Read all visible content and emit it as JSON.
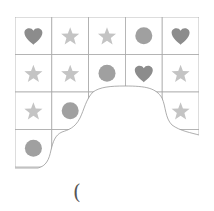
{
  "puzzle": {
    "description": "Grid of shapes with a torn-out region",
    "rows": [
      [
        "heart",
        "star",
        "star",
        "circle",
        "heart"
      ],
      [
        "star",
        "star",
        "circle",
        "heart",
        "star"
      ],
      [
        "star",
        "circle",
        null,
        null,
        "star"
      ],
      [
        "circle",
        null,
        null,
        null,
        null
      ]
    ],
    "answer_paren": "(",
    "colors": {
      "heart": "#8c8c8c",
      "circle": "#a0a0a0",
      "star": "#c4c4c4",
      "grid_line": "#aaaaaa"
    }
  }
}
